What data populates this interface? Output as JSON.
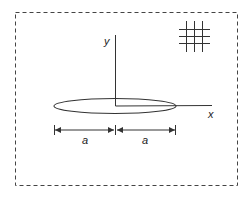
{
  "diagram": {
    "colors": {
      "stroke": "#333333",
      "border": "#444444",
      "background": "#ffffff"
    },
    "axes": {
      "x_label": "x",
      "y_label": "y"
    },
    "dimensions": [
      {
        "label": "a",
        "side": "left"
      },
      {
        "label": "a",
        "side": "right"
      }
    ],
    "shapes": {
      "crack": "ellipse",
      "border": "dashed-rectangle",
      "hatch_symbol": "grid-3x3-lines"
    }
  }
}
